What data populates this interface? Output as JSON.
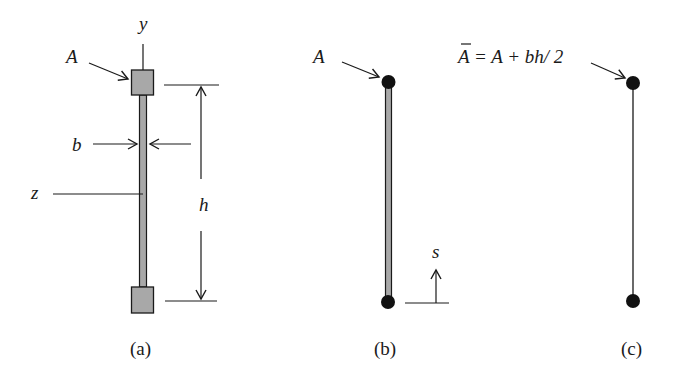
{
  "colors": {
    "ink": "#1a1a1a",
    "fill_gray": "#a8a8a8",
    "background": "#ffffff"
  },
  "panels": {
    "a": {
      "caption": "(a)",
      "labels": {
        "y_axis": "y",
        "z_axis": "z",
        "area": "A",
        "thickness": "b",
        "height": "h"
      }
    },
    "b": {
      "caption": "(b)",
      "labels": {
        "area": "A",
        "coordinate": "s"
      }
    },
    "c": {
      "caption": "(c)",
      "labels": {
        "area_bar": "A",
        "area_eq_rest": "= A + bh/ 2"
      }
    }
  }
}
